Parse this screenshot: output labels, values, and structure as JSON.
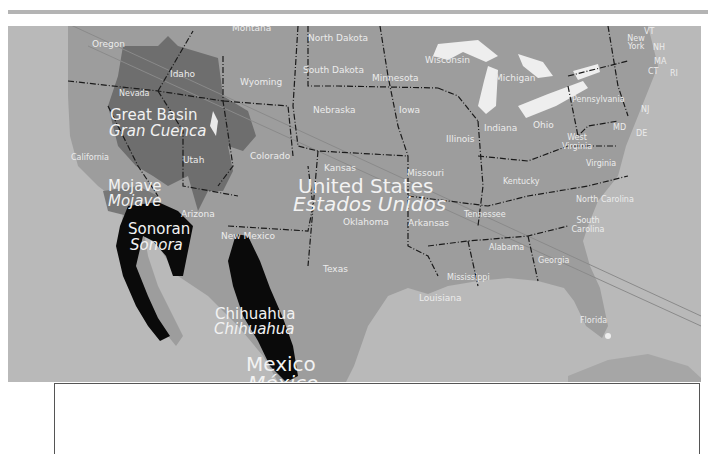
{
  "map": {
    "title": "North American Deserts",
    "colors": {
      "ocean": "#b9b9b9",
      "land": "#9c9c9c",
      "great_basin": "#6e6e6e",
      "mojave": "#787878",
      "sonoran": "#0a0a0a",
      "chihuahua": "#0a0a0a",
      "lakes": "#f0f0f0",
      "labels": "#f2f2f2"
    },
    "deserts": [
      {
        "id": "great-basin",
        "name": "Great Basin",
        "name_es": "Gran Cuenca"
      },
      {
        "id": "mojave",
        "name": "Mojave",
        "name_es": "Mojave"
      },
      {
        "id": "sonoran",
        "name": "Sonoran",
        "name_es": "Sonora"
      },
      {
        "id": "chihuahua",
        "name": "Chihuahua",
        "name_es": "Chihuahua"
      }
    ],
    "countries": [
      {
        "id": "united-states",
        "name": "United States",
        "name_es": "Estados Unidos"
      },
      {
        "id": "mexico",
        "name": "Mexico",
        "name_es": "México"
      }
    ],
    "states": {
      "montana": "Montana",
      "north_dakota": "North Dakota",
      "oregon": "Oregon",
      "idaho": "Idaho",
      "wyoming": "Wyoming",
      "south_dakota": "South Dakota",
      "nevada": "Nevada",
      "nebraska": "Nebraska",
      "minnesota": "Minnesota",
      "wisconsin": "Wisconsin",
      "michigan": "Michigan",
      "iowa": "Iowa",
      "illinois": "Illinois",
      "indiana": "Indiana",
      "ohio": "Ohio",
      "pennsylvania": "Pennsylvania",
      "new_york": "New York",
      "vt": "VT",
      "nh": "NH",
      "ma": "MA",
      "ct": "CT",
      "ri": "RI",
      "nj": "NJ",
      "md": "MD",
      "de": "DE",
      "west_virginia": "West Virginia",
      "virginia": "Virginia",
      "kentucky": "Kentucky",
      "california": "California",
      "utah": "Utah",
      "colorado": "Colorado",
      "kansas": "Kansas",
      "missouri": "Missouri",
      "arizona": "Arizona",
      "new_mexico": "New Mexico",
      "oklahoma": "Oklahoma",
      "arkansas": "Arkansas",
      "tennessee": "Tennessee",
      "north_carolina": "North Carolina",
      "south_carolina": "South Carolina",
      "texas": "Texas",
      "mississippi": "Mississippi",
      "alabama": "Alabama",
      "georgia": "Georgia",
      "louisiana": "Louisiana",
      "florida": "Florida"
    }
  }
}
